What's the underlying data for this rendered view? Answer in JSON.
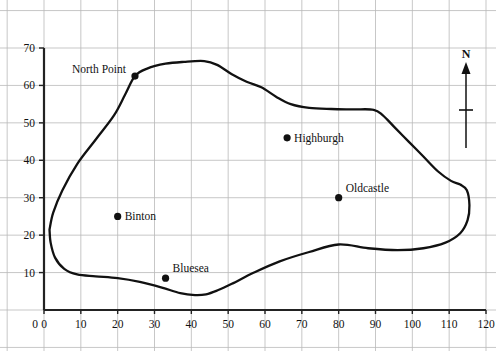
{
  "figure": {
    "title": "",
    "background_color": "#ffffff",
    "grid_color": "#b9b9b9",
    "axis_color": "#222222",
    "coastline_color": "#111111"
  },
  "compass": {
    "label": "N",
    "name": "north-arrow"
  },
  "chart_data": {
    "type": "line",
    "title": "",
    "xlabel": "",
    "ylabel": "",
    "xlim": [
      0,
      120
    ],
    "ylim": [
      0,
      70
    ],
    "grid": true,
    "legend": "none",
    "xticks": [
      0,
      10,
      20,
      30,
      40,
      50,
      60,
      70,
      80,
      90,
      100,
      110,
      120
    ],
    "yticks": [
      0,
      10,
      20,
      30,
      40,
      50,
      60,
      70
    ],
    "xtick_labels": [
      "0",
      "10",
      "20",
      "30",
      "40",
      "50",
      "60",
      "70",
      "80",
      "90",
      "100",
      "110",
      "120"
    ],
    "ytick_labels": [
      "0",
      "10",
      "20",
      "30",
      "40",
      "50",
      "60",
      "70"
    ],
    "series": [
      {
        "name": "coastline",
        "closed": true,
        "x": [
          1.5,
          2.5,
          5.0,
          9.0,
          14.0,
          19.0,
          22.0,
          24.7,
          28.0,
          33.0,
          38.0,
          43.5,
          47.0,
          51.0,
          55.0,
          59.0,
          63.0,
          67.0,
          72.0,
          78.0,
          84.0,
          89.5,
          92.0,
          95.0,
          99.0,
          103.0,
          107.0,
          110.5,
          113.0,
          114.8,
          115.5,
          115.0,
          113.0,
          109.0,
          103.0,
          96.0,
          88.0,
          80.0,
          72.0,
          64.0,
          57.0,
          51.0,
          47.0,
          44.0,
          41.0,
          37.0,
          32.0,
          26.0,
          20.0,
          14.0,
          9.0,
          5.5,
          3.0,
          1.8,
          1.5
        ],
        "y": [
          21.5,
          26.0,
          32.0,
          39.0,
          45.5,
          52.0,
          57.5,
          62.5,
          64.5,
          65.8,
          66.3,
          66.5,
          65.5,
          63.0,
          61.0,
          59.5,
          57.0,
          55.0,
          54.0,
          53.7,
          53.6,
          53.5,
          52.0,
          49.0,
          45.0,
          41.0,
          37.0,
          34.5,
          33.5,
          32.0,
          28.0,
          24.0,
          20.5,
          18.0,
          16.5,
          16.0,
          16.5,
          17.5,
          15.5,
          13.0,
          10.0,
          7.0,
          5.2,
          4.2,
          4.0,
          4.5,
          6.0,
          7.5,
          8.5,
          9.0,
          9.5,
          11.0,
          14.0,
          18.0,
          21.5
        ]
      }
    ],
    "points": [
      {
        "name": "North Point",
        "x": 24.7,
        "y": 62.5,
        "label_side": "left"
      },
      {
        "name": "Highburgh",
        "x": 66.0,
        "y": 46.0,
        "label_side": "right"
      },
      {
        "name": "Oldcastle",
        "x": 80.0,
        "y": 30.0,
        "label_side": "right-above"
      },
      {
        "name": "Binton",
        "x": 20.0,
        "y": 25.0,
        "label_side": "right"
      },
      {
        "name": "Bluesea",
        "x": 33.0,
        "y": 8.5,
        "label_side": "right-above"
      }
    ]
  }
}
